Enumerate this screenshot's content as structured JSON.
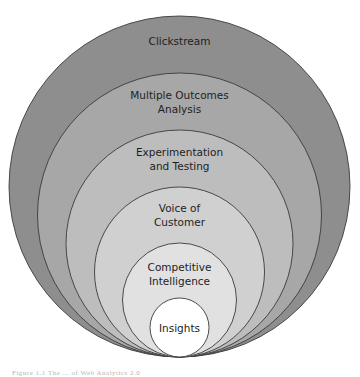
{
  "diagram": {
    "stroke_color": "#3a3a3a",
    "cx": 179.5,
    "bottom_y": 357,
    "rings": [
      {
        "name": "clickstream",
        "radius": 170.5,
        "fill": "#8e8e8e",
        "lines": [
          "Clickstream"
        ],
        "label_y": [
          45
        ]
      },
      {
        "name": "multiple-outcomes",
        "radius": 142,
        "fill": "#a7a7a7",
        "lines": [
          "Multiple Outcomes",
          "Analysis"
        ],
        "label_y": [
          99,
          113
        ]
      },
      {
        "name": "experimentation",
        "radius": 113.5,
        "fill": "#bdbdbd",
        "lines": [
          "Experimentation",
          "and Testing"
        ],
        "label_y": [
          156,
          170
        ]
      },
      {
        "name": "voice-of-customer",
        "radius": 85,
        "fill": "#d0d0d0",
        "lines": [
          "Voice of",
          "Customer"
        ],
        "label_y": [
          212,
          226
        ]
      },
      {
        "name": "competitive-intel",
        "radius": 57,
        "fill": "#e1e1e1",
        "lines": [
          "Competitive",
          "Intelligence"
        ],
        "label_y": [
          271,
          285
        ]
      },
      {
        "name": "insights",
        "radius": 29.5,
        "fill": "#ffffff",
        "lines": [
          "Insights"
        ],
        "label_y": [
          332
        ]
      }
    ]
  },
  "caption": "Figure 1.1 The ... of Web Analytics 2.0"
}
